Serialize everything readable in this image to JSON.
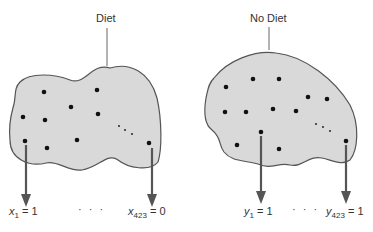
{
  "diagram": {
    "colors": {
      "blob_fill": "#d9d9d9",
      "blob_stroke": "#555555",
      "dot": "#111111",
      "arrow": "#555555"
    },
    "groups": [
      {
        "title": "Diet",
        "first": {
          "var": "x",
          "sub": "1",
          "value": "= 1"
        },
        "ellipsis": "· · ·",
        "last": {
          "var": "x",
          "sub": "423",
          "value": "= 0"
        }
      },
      {
        "title": "No Diet",
        "first": {
          "var": "y",
          "sub": "1",
          "value": "= 1"
        },
        "ellipsis": "· · ·",
        "last": {
          "var": "y",
          "sub": "423",
          "value": "= 1"
        }
      }
    ]
  }
}
